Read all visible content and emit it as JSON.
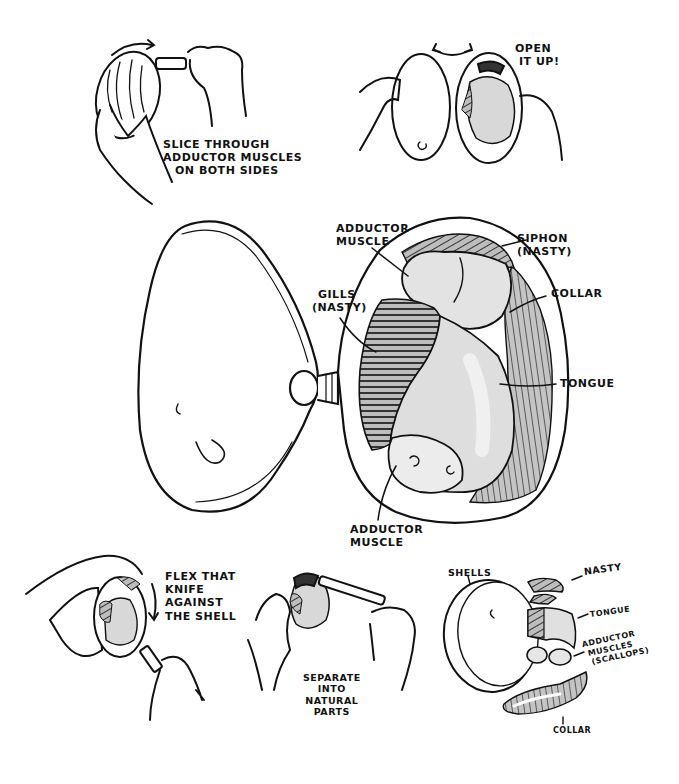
{
  "colors": {
    "ink": "#111111",
    "background": "#ffffff",
    "flesh_light": "#e6e6e6",
    "flesh_mid": "#cfcfcf",
    "hatch": "#9a9a9a"
  },
  "steps": {
    "step1": {
      "caption_lines": [
        "Slice through",
        "adductor muscles",
        "on both sides"
      ],
      "icons": [
        "clam-shell-icon",
        "knife-icon",
        "hand-icon",
        "rotate-arrow-icon"
      ]
    },
    "step2": {
      "caption_lines": [
        "Open",
        "it up!"
      ],
      "icons": [
        "open-shell-icon",
        "double-arrow-icon",
        "hand-icon"
      ]
    },
    "step3": {
      "caption_lines": [
        "Flex that",
        "knife",
        "against",
        "the shell"
      ],
      "icons": [
        "down-arrow-icon",
        "knife-icon",
        "hand-icon"
      ]
    },
    "step4": {
      "caption_lines": [
        "Separate",
        "into",
        "natural",
        "parts"
      ],
      "icons": [
        "knife-icon",
        "hand-icon"
      ]
    }
  },
  "anatomy": {
    "labels": {
      "adductor_top": [
        "Adductor",
        "muscle"
      ],
      "siphon": [
        "Siphon",
        "(nasty)"
      ],
      "gills": [
        "Gills",
        "(nasty)"
      ],
      "collar": "Collar",
      "tongue": "Tongue",
      "adductor_bottom": [
        "Adductor",
        "muscle"
      ]
    }
  },
  "parts": {
    "labels": {
      "shells": "Shells",
      "nasty": "Nasty",
      "tongue": "Tongue",
      "adductor": [
        "Adductor",
        "muscles",
        "(scallops)"
      ],
      "collar": "Collar"
    }
  }
}
